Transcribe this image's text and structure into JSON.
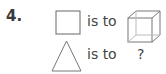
{
  "question": {
    "number": "4.",
    "rows": [
      {
        "shape": "square-icon",
        "relation": "is to",
        "answer_shape": "cube-icon"
      },
      {
        "shape": "triangle-icon",
        "relation": "is to",
        "answer": "?"
      }
    ]
  }
}
